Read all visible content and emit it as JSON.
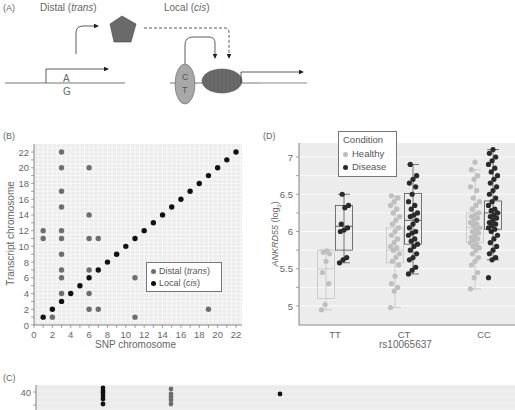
{
  "panel_a": {
    "label": "(A)",
    "distal_title": "Distal",
    "distal_italic": "trans",
    "local_title": "Local",
    "local_italic": "cis",
    "allele_top": "A",
    "allele_bottom": "G",
    "snp_top": "C",
    "snp_bottom": "T"
  },
  "chart_data": [
    {
      "panel": "(B)",
      "type": "scatter",
      "title": "",
      "xlabel": "SNP chromosome",
      "ylabel": "Transcript chromosome",
      "xlim": [
        0,
        22
      ],
      "ylim": [
        0,
        22
      ],
      "xticks": [
        "0",
        "2",
        "4",
        "6",
        "8",
        "10",
        "12",
        "14",
        "16",
        "18",
        "20",
        "22"
      ],
      "yticks": [
        "0",
        "2",
        "4",
        "6",
        "8",
        "10",
        "12",
        "14",
        "16",
        "18",
        "20",
        "22"
      ],
      "grid": true,
      "legend_position": "lower right",
      "legend": [
        {
          "name": "Distal",
          "italic": "trans",
          "color": "#6e6e6e"
        },
        {
          "name": "Local",
          "italic": "cis",
          "color": "#111111"
        }
      ],
      "series": [
        {
          "name": "Distal (trans)",
          "color": "#6e6e6e",
          "points": [
            [
              1,
              12
            ],
            [
              1,
              11
            ],
            [
              2,
              1
            ],
            [
              3,
              22
            ],
            [
              3,
              20
            ],
            [
              3,
              17
            ],
            [
              3,
              15
            ],
            [
              3,
              12
            ],
            [
              3,
              11
            ],
            [
              3,
              9
            ],
            [
              3,
              7
            ],
            [
              3,
              6
            ],
            [
              3,
              4
            ],
            [
              6,
              20
            ],
            [
              6,
              14
            ],
            [
              6,
              11
            ],
            [
              6,
              7
            ],
            [
              6,
              4
            ],
            [
              6,
              2
            ],
            [
              7,
              11
            ],
            [
              7,
              2
            ],
            [
              11,
              6
            ],
            [
              11,
              1
            ],
            [
              19,
              2
            ]
          ]
        },
        {
          "name": "Local (cis)",
          "color": "#111111",
          "points": [
            [
              1,
              1
            ],
            [
              2,
              2
            ],
            [
              3,
              3
            ],
            [
              4,
              4
            ],
            [
              5,
              5
            ],
            [
              6,
              6
            ],
            [
              7,
              7
            ],
            [
              8,
              8
            ],
            [
              9,
              9
            ],
            [
              10,
              10
            ],
            [
              11,
              11
            ],
            [
              12,
              12
            ],
            [
              13,
              13
            ],
            [
              14,
              14
            ],
            [
              15,
              15
            ],
            [
              16,
              16
            ],
            [
              17,
              17
            ],
            [
              18,
              18
            ],
            [
              19,
              19
            ],
            [
              20,
              20
            ],
            [
              21,
              21
            ],
            [
              22,
              22
            ]
          ]
        }
      ]
    },
    {
      "panel": "(D)",
      "type": "box",
      "title": "",
      "xlabel": "rs10065637",
      "ylabel": "ANKRD55 (log2)",
      "ylabel_main": "ANKRD55",
      "ylabel_unit": "(log",
      "ylabel_sub": "2",
      "ylim": [
        4.75,
        7.2
      ],
      "yticks": [
        "5",
        "5.5",
        "6",
        "6.5",
        "7"
      ],
      "categories": [
        "TT",
        "CT",
        "CC"
      ],
      "grid": true,
      "legend_title": "Condition",
      "legend": [
        {
          "name": "Healthy",
          "color": "#bdbdbd"
        },
        {
          "name": "Disease",
          "color": "#2a2a2a"
        }
      ],
      "series": [
        {
          "name": "Healthy",
          "color": "#bdbdbd",
          "boxes": [
            {
              "category": "TT",
              "min": 4.95,
              "q1": 5.1,
              "median": 5.5,
              "q3": 5.75,
              "max": 5.75
            },
            {
              "category": "CT",
              "min": 4.98,
              "q1": 5.58,
              "median": 5.75,
              "q3": 6.05,
              "max": 6.48
            },
            {
              "category": "CC",
              "min": 5.23,
              "q1": 5.85,
              "median": 6.05,
              "q3": 6.25,
              "max": 6.83
            }
          ],
          "points": {
            "TT": [
              4.95,
              5.02,
              5.3,
              5.45,
              5.6,
              5.7,
              5.72,
              5.74
            ],
            "CT": [
              4.98,
              5.2,
              5.25,
              5.3,
              5.4,
              5.55,
              5.6,
              5.65,
              5.7,
              5.75,
              5.78,
              5.8,
              5.85,
              5.9,
              5.95,
              6.0,
              6.05,
              6.1,
              6.15,
              6.2,
              6.25,
              6.3,
              6.35,
              6.4,
              6.45,
              6.48
            ],
            "CC": [
              5.23,
              5.38,
              5.45,
              5.55,
              5.6,
              5.65,
              5.7,
              5.75,
              5.78,
              5.8,
              5.82,
              5.85,
              5.88,
              5.9,
              5.92,
              5.95,
              5.98,
              6.0,
              6.02,
              6.05,
              6.08,
              6.1,
              6.12,
              6.15,
              6.18,
              6.2,
              6.22,
              6.25,
              6.3,
              6.35,
              6.4,
              6.45,
              6.55,
              6.6,
              6.7,
              6.75,
              6.83,
              6.93
            ]
          }
        },
        {
          "name": "Disease",
          "color": "#2a2a2a",
          "boxes": [
            {
              "category": "TT",
              "min": 5.58,
              "q1": 5.75,
              "median": 6.07,
              "q3": 6.35,
              "max": 6.5
            },
            {
              "category": "CT",
              "min": 5.43,
              "q1": 5.83,
              "median": 6.15,
              "q3": 6.51,
              "max": 6.9
            },
            {
              "category": "CC",
              "min": 5.62,
              "q1": 6.03,
              "median": 6.25,
              "q3": 6.41,
              "max": 7.1
            }
          ],
          "points": {
            "TT": [
              5.58,
              5.62,
              5.65,
              6.0,
              6.02,
              6.05,
              6.1,
              6.32,
              6.35,
              6.5
            ],
            "CT": [
              5.43,
              5.48,
              5.52,
              5.62,
              5.65,
              5.7,
              5.75,
              5.8,
              5.83,
              5.87,
              5.9,
              5.95,
              5.98,
              6.0,
              6.05,
              6.1,
              6.15,
              6.2,
              6.22,
              6.25,
              6.3,
              6.35,
              6.4,
              6.5,
              6.6,
              6.65,
              6.7,
              6.75,
              6.9
            ],
            "CC": [
              5.38,
              5.62,
              5.65,
              5.7,
              5.75,
              5.8,
              5.85,
              5.9,
              5.95,
              6.0,
              6.03,
              6.05,
              6.08,
              6.1,
              6.12,
              6.15,
              6.18,
              6.2,
              6.22,
              6.25,
              6.28,
              6.3,
              6.35,
              6.4,
              6.45,
              6.5,
              6.55,
              6.6,
              6.65,
              6.7,
              6.75,
              6.8,
              6.85,
              6.9,
              6.95,
              7.0,
              7.05,
              7.1
            ]
          }
        }
      ]
    },
    {
      "panel": "(C)",
      "type": "scatter",
      "title": "",
      "yticks": [
        "40"
      ],
      "grid": true,
      "partial": true,
      "series": [
        {
          "name": "Local (cis)",
          "color": "#111111",
          "points_px": [
            [
              103,
              388
            ],
            [
              103,
              391
            ],
            [
              103,
              393
            ],
            [
              103,
              396
            ],
            [
              103,
              399
            ],
            [
              103,
              404
            ],
            [
              280,
              394
            ]
          ]
        },
        {
          "name": "Distal (trans)",
          "color": "#6e6e6e",
          "points_px": [
            [
              171,
              389
            ],
            [
              171,
              394
            ],
            [
              171,
              397
            ],
            [
              171,
              400
            ],
            [
              171,
              404
            ]
          ]
        }
      ]
    }
  ]
}
